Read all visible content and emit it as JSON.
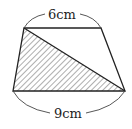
{
  "figure": {
    "shape": "trapezoid",
    "top_base_label": "6cm",
    "bottom_base_label": "9cm",
    "shaded_region": "triangle formed by top-left, bottom-left and bottom-right vertices",
    "diagonal": "from top-left to bottom-right",
    "colors": {
      "stroke": "#222222",
      "hatch": "#333333",
      "background": "#ffffff"
    }
  }
}
